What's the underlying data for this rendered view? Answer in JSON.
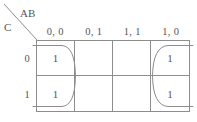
{
  "diagram": {
    "type": "karnaugh-map",
    "variables_top_label": "AB",
    "variables_side_label": "C",
    "column_headers": [
      "0, 0",
      "0, 1",
      "1, 1",
      "1, 0"
    ],
    "row_headers": [
      "0",
      "1"
    ],
    "line_color": "#8d8d8d",
    "text_color": "#555555",
    "cells": [
      {
        "row": "0",
        "col": "0, 0",
        "value": "1"
      },
      {
        "row": "0",
        "col": "0, 1",
        "value": ""
      },
      {
        "row": "0",
        "col": "1, 1",
        "value": ""
      },
      {
        "row": "0",
        "col": "1, 0",
        "value": "1"
      },
      {
        "row": "1",
        "col": "0, 0",
        "value": "1"
      },
      {
        "row": "1",
        "col": "0, 1",
        "value": ""
      },
      {
        "row": "1",
        "col": "1, 1",
        "value": ""
      },
      {
        "row": "1",
        "col": "1, 0",
        "value": "1"
      }
    ],
    "groups": [
      {
        "name": "left-wrap-group",
        "columns": [
          "0, 0"
        ],
        "rows": [
          "0",
          "1"
        ]
      },
      {
        "name": "right-wrap-group",
        "columns": [
          "1, 0"
        ],
        "rows": [
          "0",
          "1"
        ]
      }
    ]
  }
}
